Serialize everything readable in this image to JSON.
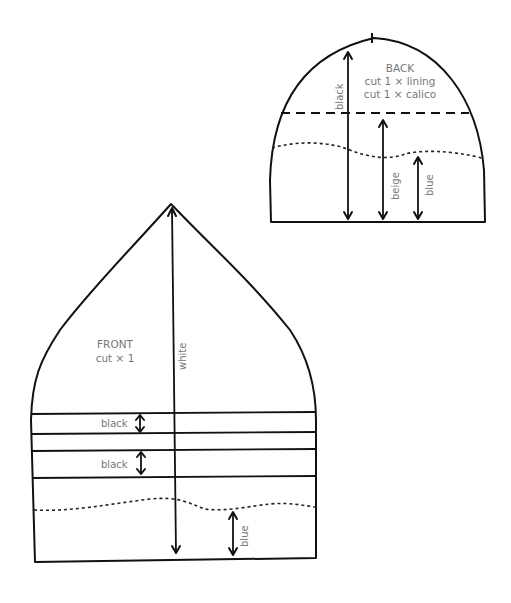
{
  "diagram": {
    "type": "sewing-pattern",
    "line_color": "#111111",
    "label_color": "#777777"
  },
  "back_piece": {
    "title": "BACK",
    "instructions": [
      "cut 1 × lining",
      "cut 1 × calico"
    ],
    "measurements": [
      {
        "label": "black",
        "from": "top",
        "to": "bottom"
      },
      {
        "label": "beige",
        "from": "dashed line",
        "to": "bottom"
      },
      {
        "label": "blue",
        "from": "wavy line",
        "to": "bottom"
      }
    ]
  },
  "front_piece": {
    "title": "FRONT",
    "instructions": [
      "cut × 1"
    ],
    "measurements": [
      {
        "label": "white",
        "from": "apex",
        "to": "bottom"
      },
      {
        "label": "black",
        "from": "band 1 top",
        "to": "band 1 bottom"
      },
      {
        "label": "black",
        "from": "band 2 top",
        "to": "band 2 bottom"
      },
      {
        "label": "blue",
        "from": "wavy line",
        "to": "bottom"
      }
    ]
  }
}
